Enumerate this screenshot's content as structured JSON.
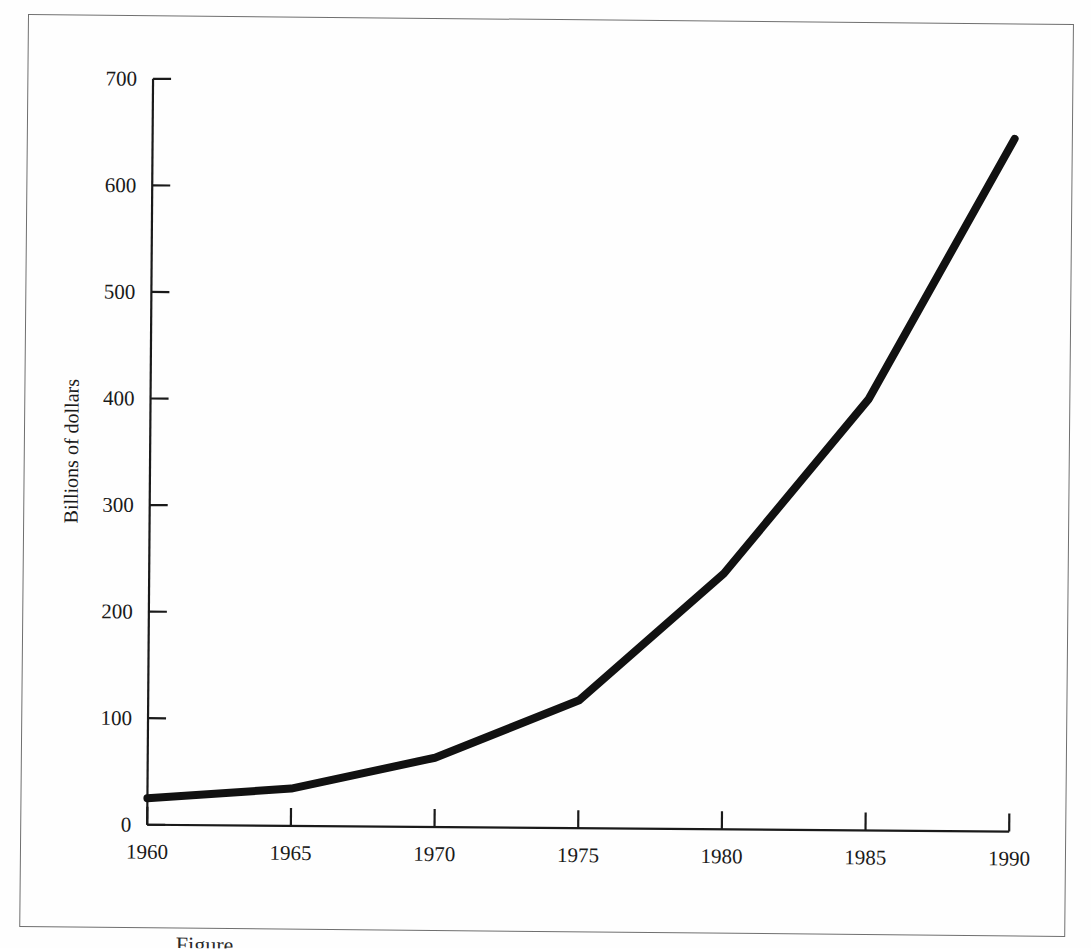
{
  "figure": {
    "caption_visible_fragment": "Figure",
    "background_color": "#fefefe",
    "line_color": "#111111",
    "axis_color": "#1a1a1a"
  },
  "axes": {
    "y_title": "Billions of dollars",
    "x_title": "",
    "y_ticks": [
      "0",
      "100",
      "200",
      "300",
      "400",
      "500",
      "600",
      "700"
    ],
    "x_ticks": [
      "1960",
      "1965",
      "1970",
      "1975",
      "1980",
      "1985",
      "1990"
    ]
  },
  "chart_data": {
    "type": "line",
    "title": "",
    "xlabel": "",
    "ylabel": "Billions of dollars",
    "x": [
      1960,
      1965,
      1970,
      1975,
      1980,
      1985,
      1990
    ],
    "values": [
      25,
      35,
      65,
      120,
      240,
      405,
      650
    ],
    "series": [
      {
        "name": "Billions of dollars",
        "values": [
          25,
          35,
          65,
          120,
          240,
          405,
          650
        ]
      }
    ],
    "xlim": [
      1960,
      1990
    ],
    "ylim": [
      0,
      700
    ],
    "xtick_values": [
      1960,
      1965,
      1970,
      1975,
      1980,
      1985,
      1990
    ],
    "ytick_values": [
      0,
      100,
      200,
      300,
      400,
      500,
      600,
      700
    ],
    "grid": false,
    "legend": false,
    "tick_direction": "in",
    "line_width_px": 8,
    "line_color": "#111111"
  }
}
